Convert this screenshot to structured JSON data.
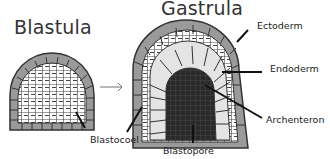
{
  "titles": {
    "blastula": "Blastula",
    "gastrula": "Gastrula"
  },
  "labels": {
    "ectoderm": "Ectoderm",
    "endoderm": "Endoderm",
    "archenteron": "Archenteron",
    "blastocoel": "Blastocoel",
    "blastopore": "Blastopore"
  },
  "colors": {
    "ectoderm_cell": "#9a9a9a",
    "endoderm_cell": "#e4e4e4",
    "archenteron": "#262626",
    "outline": "#333333"
  }
}
